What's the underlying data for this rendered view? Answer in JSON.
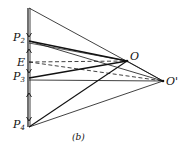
{
  "diagram": {
    "caption": "(b)",
    "labels": {
      "P2": {
        "base": "P",
        "sub": "2"
      },
      "E": {
        "base": "E"
      },
      "P3": {
        "base": "P",
        "sub": "3"
      },
      "P4": {
        "base": "P",
        "sub": "4"
      },
      "O": {
        "base": "O"
      },
      "Oprime": {
        "base": "O'"
      }
    },
    "colors": {
      "line": "#111111",
      "background": "#ffffff"
    }
  }
}
